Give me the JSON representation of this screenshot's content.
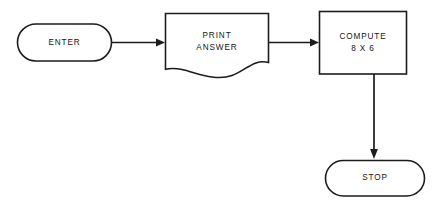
{
  "diagram": {
    "background_color": "#ffffff",
    "line_color": "#1c1c1c",
    "nodes": {
      "enter": {
        "id": "enter",
        "label": "ENTER",
        "shape": "terminal-stadium",
        "role": "start"
      },
      "print_answer": {
        "id": "print_answer",
        "label": "PRINT\nANSWER",
        "line1": "PRINT",
        "line2": "ANSWER",
        "shape": "document-wavy-bottom",
        "role": "output"
      },
      "compute": {
        "id": "compute",
        "label": "COMPUTE\n8 X 6",
        "line1": "COMPUTE",
        "line2": "8 X 6",
        "shape": "process-rectangle",
        "role": "process"
      },
      "stop": {
        "id": "stop",
        "label": "STOP",
        "shape": "terminal-stadium",
        "role": "end"
      }
    },
    "connectors": [
      {
        "id": "enter-to-print",
        "from": "enter",
        "to": "print_answer",
        "direction": "right",
        "label": ""
      },
      {
        "id": "print-to-compute",
        "from": "print_answer",
        "to": "compute",
        "direction": "right",
        "label": ""
      },
      {
        "id": "compute-to-stop",
        "from": "compute",
        "to": "stop",
        "direction": "down",
        "label": ""
      }
    ]
  }
}
